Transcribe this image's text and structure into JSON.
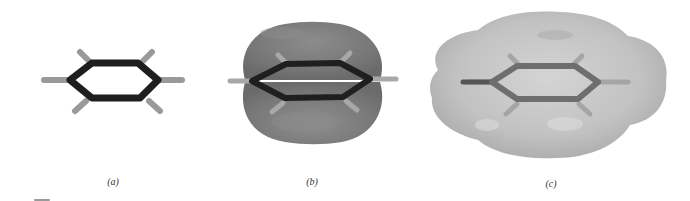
{
  "figure": {
    "panels": [
      {
        "id": "a",
        "label": "(a)",
        "representation": "ball-and-stick model",
        "center": [
          113,
          80
        ],
        "label_pos": [
          113,
          176
        ]
      },
      {
        "id": "b",
        "label": "(b)",
        "representation": "pi-orbital lobes above and below ring plane",
        "center": [
          312,
          80
        ],
        "label_pos": [
          312,
          176
        ]
      },
      {
        "id": "c",
        "label": "(c)",
        "representation": "molecular surface",
        "center": [
          551,
          80
        ],
        "label_pos": [
          551,
          178
        ]
      }
    ],
    "colors": {
      "background": "#ffffff",
      "bond_dark": "#1e1e1e",
      "hydrogen": "#9a9a9a",
      "orbital_lobe": "#7a7a7a",
      "orbital_highlight": "#959595",
      "surface": "#c4c4c4",
      "surface_shadow": "#a8a8a8",
      "surface_bond": "#6e6e6e",
      "label_text": "#333333"
    }
  }
}
